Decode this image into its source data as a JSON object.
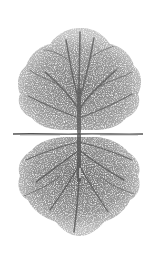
{
  "image": {
    "subject": "Tree with mirrored root system",
    "description": "Grayscale stippled illustration of a deciduous tree above a horizontal ground line, with its root system drawn below as a near mirror image of the crown.",
    "colors": {
      "background": "#ffffff",
      "foliage": "#8a8a8a",
      "foliage_light": "#b5b5b5",
      "trunk": "#4a4a4a",
      "ground_line": "#555555"
    },
    "ground_line": {
      "y": 134,
      "x_start": 13,
      "x_end": 143
    },
    "trunk_center_x": 79
  }
}
